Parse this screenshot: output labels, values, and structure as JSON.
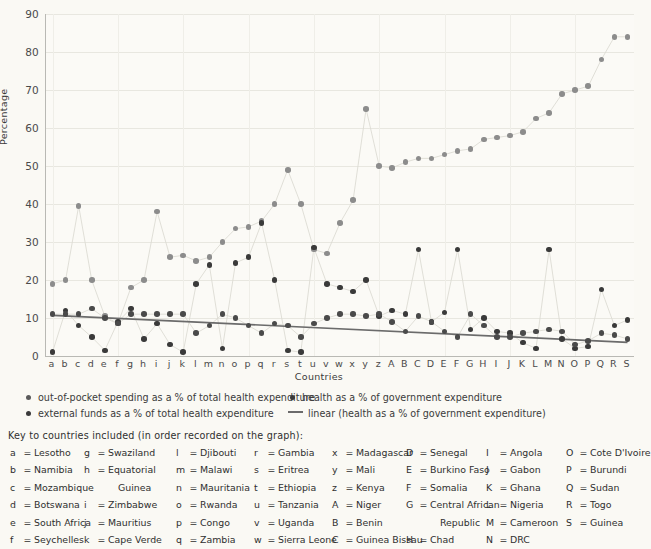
{
  "axes": {
    "ytitle": "Percentage",
    "xtitle": "Countries",
    "yticks": [
      "0",
      "10",
      "20",
      "30",
      "40",
      "50",
      "60",
      "70",
      "80",
      "90"
    ],
    "xticks": [
      "a",
      "b",
      "c",
      "d",
      "e",
      "f",
      "g",
      "h",
      "i",
      "j",
      "k",
      "l",
      "m",
      "n",
      "o",
      "p",
      "q",
      "r",
      "s",
      "t",
      "u",
      "v",
      "w",
      "x",
      "y",
      "z",
      "A",
      "B",
      "C",
      "D",
      "E",
      "F",
      "G",
      "H",
      "I",
      "J",
      "K",
      "L",
      "M",
      "N",
      "O",
      "P",
      "Q",
      "R",
      "S"
    ]
  },
  "legend": {
    "items": [
      {
        "marker": "dot-gray",
        "label": "out-of-pocket spending as a % of total health expenditure"
      },
      {
        "marker": "dot-dark",
        "label": "external funds as a % of total health expenditure"
      },
      {
        "marker": "dot-dark",
        "label": "health as a % of government expenditure"
      },
      {
        "marker": "line",
        "label": "linear (health as a % of government expenditure)"
      }
    ]
  },
  "key": {
    "title": "Key to countries included (in order recorded on the graph):",
    "columns": [
      [
        {
          "code": "a",
          "name": "Lesotho"
        },
        {
          "code": "b",
          "name": "Namibia"
        },
        {
          "code": "c",
          "name": "Mozambique"
        },
        {
          "code": "d",
          "name": "Botswana"
        },
        {
          "code": "e",
          "name": "South Africa"
        },
        {
          "code": "f",
          "name": "Seychelles"
        }
      ],
      [
        {
          "code": "g",
          "name": "Swaziland"
        },
        {
          "code": "h",
          "name": "Equatorial"
        },
        {
          "code": "",
          "name": "Guinea",
          "cont": true
        },
        {
          "code": "i",
          "name": "Zimbabwe"
        },
        {
          "code": "j",
          "name": "Mauritius"
        },
        {
          "code": "k",
          "name": "Cape Verde"
        }
      ],
      [
        {
          "code": "l",
          "name": "Djibouti"
        },
        {
          "code": "m",
          "name": "Malawi"
        },
        {
          "code": "n",
          "name": "Mauritania"
        },
        {
          "code": "o",
          "name": "Rwanda"
        },
        {
          "code": "p",
          "name": "Congo"
        },
        {
          "code": "q",
          "name": "Zambia"
        }
      ],
      [
        {
          "code": "r",
          "name": "Gambia"
        },
        {
          "code": "s",
          "name": "Eritrea"
        },
        {
          "code": "t",
          "name": "Ethiopia"
        },
        {
          "code": "u",
          "name": "Tanzania"
        },
        {
          "code": "v",
          "name": "Uganda"
        },
        {
          "code": "w",
          "name": "Sierra Leone"
        }
      ],
      [
        {
          "code": "x",
          "name": "Madagascar"
        },
        {
          "code": "y",
          "name": "Mali"
        },
        {
          "code": "z",
          "name": "Kenya"
        },
        {
          "code": "A",
          "name": "Niger"
        },
        {
          "code": "B",
          "name": "Benin"
        },
        {
          "code": "C",
          "name": "Guinea Bissau"
        }
      ],
      [
        {
          "code": "D",
          "name": "Senegal"
        },
        {
          "code": "E",
          "name": "Burkino Faso"
        },
        {
          "code": "F",
          "name": "Somalia"
        },
        {
          "code": "G",
          "name": "Central African"
        },
        {
          "code": "",
          "name": "Republic",
          "cont": true
        },
        {
          "code": "H",
          "name": "Chad"
        }
      ],
      [
        {
          "code": "I",
          "name": "Angola"
        },
        {
          "code": "J",
          "name": "Gabon"
        },
        {
          "code": "K",
          "name": "Ghana"
        },
        {
          "code": "L",
          "name": "Nigeria"
        },
        {
          "code": "M",
          "name": "Cameroon"
        },
        {
          "code": "N",
          "name": "DRC"
        }
      ],
      [
        {
          "code": "O",
          "name": "Cote D'Ivoire"
        },
        {
          "code": "P",
          "name": "Burundi"
        },
        {
          "code": "Q",
          "name": "Sudan"
        },
        {
          "code": "R",
          "name": "Togo"
        },
        {
          "code": "S",
          "name": "Guinea"
        }
      ]
    ]
  },
  "colors": {
    "background": "#faf9f4",
    "plot_background": "#fbfaf6",
    "grid": "#e8e7e0",
    "axis": "#b9b9b4",
    "series_out_of_pocket": "#8c8c8c",
    "series_external_funds": "#3a3a3a",
    "series_health_gov": "#4a4a4a",
    "trend_line": "#6b6b6b",
    "text": "#3b3b3b"
  },
  "chart_data": {
    "type": "scatter",
    "title": "",
    "xlabel": "Countries",
    "ylabel": "Percentage",
    "ylim": [
      0,
      90
    ],
    "ytick_step": 10,
    "grid": true,
    "legend_position": "below",
    "categories": [
      "a",
      "b",
      "c",
      "d",
      "e",
      "f",
      "g",
      "h",
      "i",
      "j",
      "k",
      "l",
      "m",
      "n",
      "o",
      "p",
      "q",
      "r",
      "s",
      "t",
      "u",
      "v",
      "w",
      "x",
      "y",
      "z",
      "A",
      "B",
      "C",
      "D",
      "E",
      "F",
      "G",
      "H",
      "I",
      "J",
      "K",
      "L",
      "M",
      "N",
      "O",
      "P",
      "Q",
      "R",
      "S"
    ],
    "category_labels": [
      "Lesotho",
      "Namibia",
      "Mozambique",
      "Botswana",
      "South Africa",
      "Seychelles",
      "Swaziland",
      "Equatorial Guinea",
      "Zimbabwe",
      "Mauritius",
      "Cape Verde",
      "Djibouti",
      "Malawi",
      "Mauritania",
      "Rwanda",
      "Congo",
      "Zambia",
      "Gambia",
      "Eritrea",
      "Ethiopia",
      "Tanzania",
      "Uganda",
      "Sierra Leone",
      "Madagascar",
      "Mali",
      "Kenya",
      "Niger",
      "Benin",
      "Guinea Bissau",
      "Senegal",
      "Burkino Faso",
      "Somalia",
      "Central African Republic",
      "Chad",
      "Angola",
      "Gabon",
      "Ghana",
      "Nigeria",
      "Cameroon",
      "DRC",
      "Cote D'Ivoire",
      "Burundi",
      "Sudan",
      "Togo",
      "Guinea"
    ],
    "series": [
      {
        "name": "out-of-pocket spending as a % of total health expenditure",
        "color": "#8c8c8c",
        "connected": true,
        "values": [
          19,
          20,
          39.5,
          20,
          10.5,
          8.5,
          18,
          20,
          38,
          26,
          26.5,
          25,
          26,
          30,
          33.5,
          34,
          35.5,
          40,
          49,
          40,
          28,
          27,
          35,
          41,
          65,
          50,
          49.5,
          51,
          52,
          52,
          53,
          54,
          54.5,
          57,
          57.5,
          58,
          59,
          62.5,
          64,
          69,
          70,
          71,
          78,
          84,
          84
        ]
      },
      {
        "name": "external funds as a % of total health expenditure",
        "color": "#3a3a3a",
        "connected": true,
        "values": [
          1,
          12,
          8,
          5,
          1.5,
          9,
          12.5,
          4.5,
          8.5,
          3,
          1,
          19,
          24,
          2,
          24.5,
          26,
          35,
          20,
          1.5,
          1,
          28.5,
          19,
          18,
          17,
          20,
          10.5,
          12,
          11,
          28,
          9,
          11.5,
          28,
          7,
          10,
          6.5,
          6,
          3.5,
          2,
          28,
          4.5,
          2,
          2.5,
          17.5,
          8,
          9.5
        ]
      },
      {
        "name": "health as a % of government expenditure",
        "color": "#4a4a4a",
        "connected": true,
        "values": [
          11,
          11,
          11,
          12.5,
          10,
          8.5,
          11,
          11,
          11,
          11,
          11,
          6,
          8,
          11,
          10,
          8,
          6,
          8.5,
          8,
          5,
          8.5,
          10,
          11,
          11,
          10.5,
          11,
          9,
          6.5,
          10.5,
          9,
          6.5,
          5,
          11,
          8,
          5,
          5,
          6,
          6.5,
          7,
          6.5,
          3,
          4,
          6,
          5.5,
          4.5
        ]
      }
    ],
    "trend_line": {
      "name": "linear (health as a % of government expenditure)",
      "color": "#6b6b6b",
      "start": {
        "x": "a",
        "y": 10.7
      },
      "end": {
        "x": "S",
        "y": 3.6
      }
    }
  }
}
